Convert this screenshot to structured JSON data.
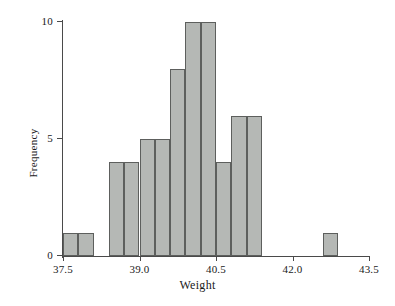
{
  "chart_data": {
    "type": "bar",
    "title": "",
    "subtitle": "",
    "xlabel": "Weight",
    "ylabel": "Frequency",
    "xlim": [
      37.5,
      43.5
    ],
    "ylim": [
      0,
      10
    ],
    "xticks": [
      "37.5",
      "39.0",
      "40.5",
      "42.0",
      "43.5"
    ],
    "xtick_values": [
      37.5,
      39.0,
      40.5,
      42.0,
      43.5
    ],
    "yticks": [
      "0",
      "5",
      "10"
    ],
    "ytick_values": [
      0,
      5,
      10
    ],
    "grid": false,
    "legend": null,
    "bin_width": 0.3,
    "bar_color": "#b5b8b5",
    "bar_edge_color": "#5d5f5d",
    "axis_color": "#4a4a4a",
    "bins": [
      {
        "left": 37.5,
        "right": 37.8,
        "value": 1
      },
      {
        "left": 37.8,
        "right": 38.1,
        "value": 1
      },
      {
        "left": 38.1,
        "right": 38.4,
        "value": 0
      },
      {
        "left": 38.4,
        "right": 38.7,
        "value": 4
      },
      {
        "left": 38.7,
        "right": 39.0,
        "value": 4
      },
      {
        "left": 39.0,
        "right": 39.3,
        "value": 5
      },
      {
        "left": 39.3,
        "right": 39.6,
        "value": 5
      },
      {
        "left": 39.6,
        "right": 39.9,
        "value": 8
      },
      {
        "left": 39.9,
        "right": 40.2,
        "value": 10
      },
      {
        "left": 40.2,
        "right": 40.5,
        "value": 10
      },
      {
        "left": 40.5,
        "right": 40.8,
        "value": 4
      },
      {
        "left": 40.8,
        "right": 41.1,
        "value": 6
      },
      {
        "left": 41.1,
        "right": 41.4,
        "value": 6
      },
      {
        "left": 41.4,
        "right": 41.7,
        "value": 0
      },
      {
        "left": 41.7,
        "right": 42.0,
        "value": 0
      },
      {
        "left": 42.0,
        "right": 42.6,
        "value": 0
      },
      {
        "left": 42.6,
        "right": 42.9,
        "value": 1
      },
      {
        "left": 42.9,
        "right": 43.5,
        "value": 0
      }
    ],
    "categories": [
      37.5,
      37.8,
      38.1,
      38.4,
      38.7,
      39.0,
      39.3,
      39.6,
      39.9,
      40.2,
      40.5,
      40.8,
      41.1,
      41.4,
      41.7,
      42.0,
      42.6,
      42.9
    ],
    "values": [
      1,
      1,
      0,
      4,
      4,
      5,
      5,
      8,
      10,
      10,
      4,
      6,
      6,
      0,
      0,
      0,
      1,
      0
    ]
  }
}
